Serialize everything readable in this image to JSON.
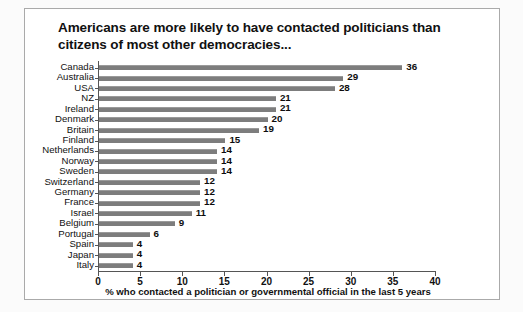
{
  "chart_data": {
    "type": "bar",
    "orientation": "horizontal",
    "title": "Americans are more likely to have contacted politicians than citizens of most other democracies...",
    "title_lines": [
      "Americans are more likely to have contacted politicians than",
      "citizens of most other democracies..."
    ],
    "subtitle": "",
    "xlabel": "% who contacted a politician or governmental official in the last 5 years",
    "ylabel": "",
    "xlim": [
      0,
      40
    ],
    "xticks": [
      0,
      5,
      10,
      15,
      20,
      25,
      30,
      35,
      40
    ],
    "xtick_labels": [
      "0",
      "5",
      "10",
      "15",
      "20",
      "25",
      "30",
      "35",
      "40"
    ],
    "grid": false,
    "legend": null,
    "bar_color": "#7d7d7d",
    "categories": [
      "Canada",
      "Australia",
      "USA",
      "NZ",
      "Ireland",
      "Denmark",
      "Britain",
      "Finland",
      "Netherlands",
      "Norway",
      "Sweden",
      "Switzerland",
      "Germany",
      "France",
      "Israel",
      "Belgium",
      "Portugal",
      "Spain",
      "Japan",
      "Italy"
    ],
    "values": [
      36,
      29,
      28,
      21,
      21,
      20,
      19,
      15,
      14,
      14,
      14,
      12,
      12,
      12,
      11,
      9,
      6,
      4,
      4,
      4
    ],
    "value_labels": [
      "36",
      "29",
      "28",
      "21",
      "21",
      "20",
      "19",
      "15",
      "14",
      "14",
      "14",
      "12",
      "12",
      "12",
      "11",
      "9",
      "6",
      "4",
      "4",
      "4"
    ]
  }
}
